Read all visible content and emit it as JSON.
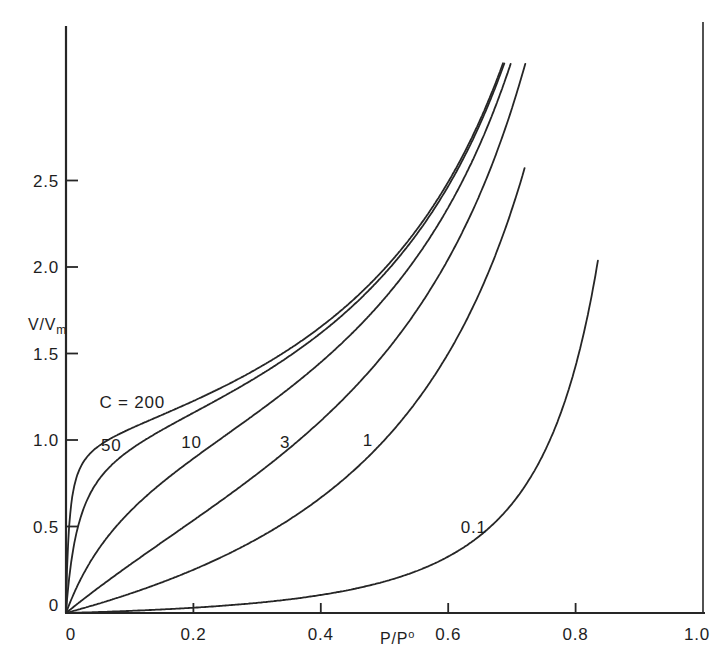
{
  "figure": {
    "background": "#ffffff",
    "line_color": "#262626",
    "text_color": "#1e1e1e"
  },
  "chart_data": {
    "type": "line",
    "title": "",
    "description_visible_text_only": "BET multilayer adsorption isotherm family",
    "xlabel": "P/P°",
    "xlabel_main": "P/P",
    "xlabel_sup": "o",
    "ylabel": "V/Vm",
    "ylabel_main": "V/V",
    "ylabel_sub": "m",
    "xlim": [
      0,
      1.0
    ],
    "ylim": [
      0,
      3.4
    ],
    "grid": false,
    "legend": "labels on curves",
    "saturation_line_x": 1.0,
    "x_ticks": [
      {
        "value": 0.0,
        "label": "0",
        "mark": false,
        "dx": 5
      },
      {
        "value": 0.2,
        "label": "0.2",
        "mark": true
      },
      {
        "value": 0.4,
        "label": "0.4",
        "mark": true
      },
      {
        "value": 0.6,
        "label": "0.6",
        "mark": true
      },
      {
        "value": 0.8,
        "label": "0.8",
        "mark": true
      },
      {
        "value": 1.0,
        "label": "1.0",
        "mark": false,
        "dx": -6
      }
    ],
    "y_ticks": [
      {
        "value": 0.0,
        "label": "0",
        "mark": false,
        "dy": -8
      },
      {
        "value": 0.5,
        "label": "0.5",
        "mark": true
      },
      {
        "value": 1.0,
        "label": "1.0",
        "mark": true
      },
      {
        "value": 1.5,
        "label": "1.5",
        "mark": true
      },
      {
        "value": 2.0,
        "label": "2.0",
        "mark": true
      },
      {
        "value": 2.5,
        "label": "2.5",
        "mark": true
      }
    ],
    "series": [
      {
        "name": "C=200",
        "label": "C = 200",
        "C": 200,
        "x_end": 0.686,
        "label_x": 0.104,
        "label_y": 1.22,
        "points": [
          [
            0,
            0
          ],
          [
            0.02,
            0.82
          ],
          [
            0.05,
            0.96
          ],
          [
            0.1,
            1.06
          ],
          [
            0.15,
            1.14
          ],
          [
            0.2,
            1.23
          ],
          [
            0.25,
            1.31
          ],
          [
            0.3,
            1.41
          ],
          [
            0.35,
            1.52
          ],
          [
            0.4,
            1.65
          ],
          [
            0.45,
            1.81
          ],
          [
            0.5,
            1.99
          ],
          [
            0.55,
            2.21
          ],
          [
            0.6,
            2.49
          ],
          [
            0.65,
            2.85
          ],
          [
            0.686,
            3.17
          ]
        ]
      },
      {
        "name": "C=50",
        "label": "50",
        "C": 50,
        "x_end": 0.688,
        "label_x": 0.071,
        "label_y": 0.97,
        "points": [
          [
            0,
            0
          ],
          [
            0.02,
            0.52
          ],
          [
            0.05,
            0.76
          ],
          [
            0.1,
            0.94
          ],
          [
            0.15,
            1.06
          ],
          [
            0.2,
            1.16
          ],
          [
            0.25,
            1.26
          ],
          [
            0.3,
            1.37
          ],
          [
            0.35,
            1.48
          ],
          [
            0.4,
            1.62
          ],
          [
            0.45,
            1.78
          ],
          [
            0.5,
            1.96
          ],
          [
            0.55,
            2.19
          ],
          [
            0.6,
            2.47
          ],
          [
            0.65,
            2.83
          ],
          [
            0.688,
            3.17
          ]
        ]
      },
      {
        "name": "C=10",
        "label": "10",
        "C": 10,
        "x_end": 0.698,
        "label_x": 0.197,
        "label_y": 0.99,
        "points": [
          [
            0,
            0
          ],
          [
            0.05,
            0.36
          ],
          [
            0.1,
            0.59
          ],
          [
            0.15,
            0.75
          ],
          [
            0.2,
            0.89
          ],
          [
            0.25,
            1.03
          ],
          [
            0.3,
            1.16
          ],
          [
            0.35,
            1.3
          ],
          [
            0.4,
            1.45
          ],
          [
            0.45,
            1.62
          ],
          [
            0.5,
            1.82
          ],
          [
            0.55,
            2.05
          ],
          [
            0.6,
            2.34
          ],
          [
            0.65,
            2.71
          ],
          [
            0.698,
            3.17
          ]
        ]
      },
      {
        "name": "C=3",
        "label": "3",
        "C": 3,
        "x_end": 0.721,
        "label_x": 0.344,
        "label_y": 0.99,
        "points": [
          [
            0,
            0
          ],
          [
            0.05,
            0.14
          ],
          [
            0.1,
            0.28
          ],
          [
            0.15,
            0.41
          ],
          [
            0.2,
            0.54
          ],
          [
            0.25,
            0.67
          ],
          [
            0.3,
            0.8
          ],
          [
            0.35,
            0.95
          ],
          [
            0.4,
            1.11
          ],
          [
            0.45,
            1.29
          ],
          [
            0.5,
            1.5
          ],
          [
            0.55,
            1.75
          ],
          [
            0.6,
            2.05
          ],
          [
            0.65,
            2.42
          ],
          [
            0.7,
            2.92
          ],
          [
            0.721,
            3.18
          ]
        ]
      },
      {
        "name": "C=1",
        "label": "1",
        "C": 1,
        "x_end": 0.72,
        "label_x": 0.474,
        "label_y": 1.0,
        "points": [
          [
            0,
            0
          ],
          [
            0.1,
            0.11
          ],
          [
            0.2,
            0.25
          ],
          [
            0.3,
            0.43
          ],
          [
            0.4,
            0.67
          ],
          [
            0.5,
            1.0
          ],
          [
            0.55,
            1.22
          ],
          [
            0.6,
            1.5
          ],
          [
            0.65,
            1.86
          ],
          [
            0.7,
            2.33
          ],
          [
            0.72,
            2.57
          ]
        ]
      },
      {
        "name": "C=0.1",
        "label": "0.1",
        "C": 0.1,
        "x_end": 0.835,
        "label_x": 0.64,
        "label_y": 0.5,
        "points": [
          [
            0,
            0
          ],
          [
            0.1,
            0.01
          ],
          [
            0.2,
            0.03
          ],
          [
            0.3,
            0.06
          ],
          [
            0.4,
            0.1
          ],
          [
            0.5,
            0.18
          ],
          [
            0.55,
            0.24
          ],
          [
            0.6,
            0.33
          ],
          [
            0.65,
            0.45
          ],
          [
            0.7,
            0.63
          ],
          [
            0.75,
            0.92
          ],
          [
            0.8,
            1.43
          ],
          [
            0.835,
            2.04
          ]
        ]
      }
    ]
  }
}
